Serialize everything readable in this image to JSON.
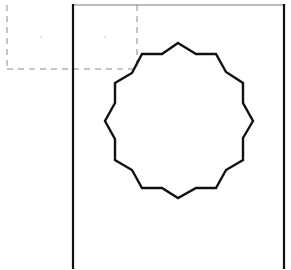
{
  "canvas": {
    "width": 291,
    "height": 270,
    "background": "#ffffff"
  },
  "frame": {
    "top_line": {
      "x1": 73,
      "y1": 5,
      "x2": 284,
      "y2": 5,
      "color": "#7a7a7a",
      "width": 1.2
    },
    "left_wall": {
      "x1": 73,
      "y1": 5,
      "x2": 73,
      "y2": 268,
      "color": "#111111",
      "width": 2.2
    },
    "right_wall": {
      "x1": 284,
      "y1": 5,
      "x2": 284,
      "y2": 268,
      "color": "#111111",
      "width": 2.2
    }
  },
  "selection_box": {
    "left": 7,
    "top": 5,
    "right": 137,
    "bottom": 69,
    "color": "#8a8a8a",
    "width": 1,
    "dash": "6,5",
    "marks": [
      {
        "x": 41,
        "y": 37
      },
      {
        "x": 105,
        "y": 37
      }
    ]
  },
  "polygon": {
    "name": "twelve-point-star-gear",
    "stroke": "#111111",
    "stroke_width": 2.4,
    "fill": "none",
    "points": [
      [
        178,
        43
      ],
      [
        196,
        54
      ],
      [
        216,
        54
      ],
      [
        226,
        72
      ],
      [
        243,
        83
      ],
      [
        243,
        103
      ],
      [
        253,
        121
      ],
      [
        243,
        138
      ],
      [
        243,
        160
      ],
      [
        226,
        170
      ],
      [
        216,
        188
      ],
      [
        196,
        188
      ],
      [
        178,
        198
      ],
      [
        162,
        188
      ],
      [
        142,
        188
      ],
      [
        132,
        170
      ],
      [
        115,
        160
      ],
      [
        115,
        139
      ],
      [
        105,
        121
      ],
      [
        115,
        103
      ],
      [
        115,
        83
      ],
      [
        132,
        73
      ],
      [
        142,
        54
      ],
      [
        162,
        54
      ]
    ]
  }
}
